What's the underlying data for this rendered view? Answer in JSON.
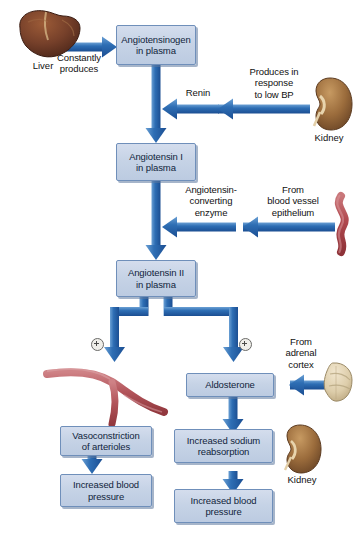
{
  "diagram": {
    "colors": {
      "box_fill": "#c6d3e6",
      "box_border": "#6f8fba",
      "arrow_blue": "#2f6fb5",
      "arrow_blue_dark": "#1f5header",
      "vessel_red": "#b85a5e",
      "liver_brown": "#7a4228",
      "kidney_brown": "#9a6a3c",
      "adrenal_beige": "#ded0b4",
      "background": "#ffffff"
    },
    "nodes": [
      {
        "id": "angiotensinogen",
        "label": "Angiotensinogen\nin plasma",
        "line1": "Angiotensinogen",
        "line2": "in plasma"
      },
      {
        "id": "angiotensin-1",
        "label": "Angiotensin I\nin plasma",
        "line1": "Angiotensin I",
        "line2": "in plasma"
      },
      {
        "id": "angiotensin-2",
        "label": "Angiotensin II\nin plasma",
        "line1": "Angiotensin II",
        "line2": "in plasma"
      },
      {
        "id": "aldosterone",
        "label": "Aldosterone",
        "line1": "Aldosterone",
        "line2": ""
      },
      {
        "id": "vasoconstriction",
        "label": "Vasoconstriction\nof arterioles",
        "line1": "Vasoconstriction",
        "line2": "of arterioles"
      },
      {
        "id": "increased-bp-left",
        "label": "Increased blood\npressure",
        "line1": "Increased blood",
        "line2": "pressure"
      },
      {
        "id": "sodium-reabsorption",
        "label": "Increased sodium\nreabsorption",
        "line1": "Increased sodium",
        "line2": "reabsorption"
      },
      {
        "id": "increased-bp-right",
        "label": "Increased blood\npressure",
        "line1": "Increased blood",
        "line2": "pressure"
      }
    ],
    "edge_labels": [
      {
        "id": "constantly-produces",
        "line1": "Constantly",
        "line2": "produces",
        "line3": ""
      },
      {
        "id": "renin",
        "line1": "Renin",
        "line2": "",
        "line3": ""
      },
      {
        "id": "produces-low-bp",
        "line1": "Produces in",
        "line2": "response",
        "line3": "to low BP"
      },
      {
        "id": "ace",
        "line1": "Angiotensin-",
        "line2": "converting",
        "line3": "enzyme"
      },
      {
        "id": "from-blood-vessel",
        "line1": "From",
        "line2": "blood vessel",
        "line3": "epithelium"
      },
      {
        "id": "from-adrenal-cortex",
        "line1": "From",
        "line2": "adrenal",
        "line3": "cortex"
      }
    ],
    "organs": [
      {
        "id": "liver",
        "caption": "Liver"
      },
      {
        "id": "kidney-top",
        "caption": "Kidney"
      },
      {
        "id": "blood-vessel",
        "caption": ""
      },
      {
        "id": "adrenal-cortex",
        "caption": ""
      },
      {
        "id": "artery",
        "caption": ""
      },
      {
        "id": "kidney-bottom",
        "caption": "Kidney"
      }
    ],
    "symbols": [
      {
        "id": "plus-left",
        "glyph": "+"
      },
      {
        "id": "plus-right",
        "glyph": "+"
      }
    ]
  }
}
